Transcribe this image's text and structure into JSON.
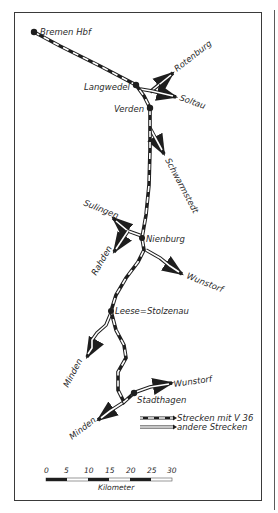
{
  "map": {
    "stations": {
      "bremen": "Bremen Hbf",
      "langwedel": "Langwedel",
      "verden": "Verden",
      "nienburg": "Nienburg",
      "leese": "Leese=Stolzenau",
      "stadthagen": "Stadthagen"
    },
    "destinations": {
      "rotenburg": "Rotenburg",
      "soltau": "Soltau",
      "schwarmstedt": "Schwarmstedt",
      "sulingen": "Sulingen",
      "rahden": "Rahden",
      "wunstorf_upper": "Wunstorf",
      "minden_upper": "Minden",
      "wunstorf_lower": "Wunstorf",
      "minden_lower": "Minden"
    },
    "legend": {
      "v36": "Strecken mit V 36",
      "other": "andere Strecken"
    },
    "scale": {
      "ticks": [
        "0",
        "5",
        "10",
        "15",
        "20",
        "25",
        "30"
      ],
      "unit": "Kilometer"
    },
    "colors": {
      "ink": "#1e1e1e",
      "paper": "#ffffff",
      "frame": "#3a3a3a"
    }
  }
}
